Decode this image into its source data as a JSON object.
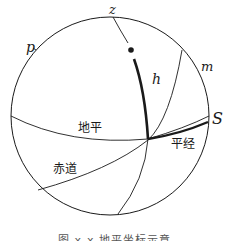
{
  "figure": {
    "labels": {
      "zenith": "z",
      "pole": "p",
      "meridian": "m",
      "star": "S",
      "altitude": "h",
      "horizon": "地平",
      "equator": "赤道",
      "azimuth": "平经"
    },
    "caption": "图 x-x 地平坐标示意图",
    "colors": {
      "stroke": "#1a1a1a",
      "background": "#ffffff"
    }
  }
}
